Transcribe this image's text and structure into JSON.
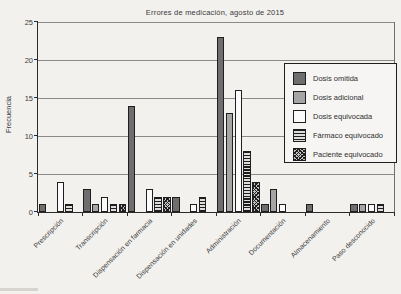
{
  "chart_data": {
    "type": "bar",
    "title": "Errores de medicación, agosto de 2015",
    "xlabel": "",
    "ylabel": "Frecuencia",
    "ylim": [
      0,
      25
    ],
    "yticks": [
      0,
      5,
      10,
      15,
      20,
      25
    ],
    "grid": true,
    "legend_position": "inside-right",
    "categories": [
      "Prescripción",
      "Transcripción",
      "Dispensación en farmacia",
      "Dispensación en unidades",
      "Administración",
      "Documentación",
      "Almacenamiento",
      "Paso desconocido"
    ],
    "series": [
      {
        "name": "Dosis omitida",
        "pattern": "solid-dark",
        "color": "#6e6e6e",
        "values": [
          1,
          3,
          14,
          2,
          23,
          1,
          1,
          1
        ]
      },
      {
        "name": "Dosis adicional",
        "pattern": "solid-medium",
        "color": "#a5a5a5",
        "values": [
          0,
          1,
          0,
          0,
          13,
          3,
          0,
          1
        ]
      },
      {
        "name": "Dosis equivocada",
        "pattern": "solid-white",
        "color": "#fbfbfb",
        "values": [
          4,
          2,
          3,
          1,
          16,
          1,
          0,
          1
        ]
      },
      {
        "name": "Fármaco equivocado",
        "pattern": "hlines",
        "color": "#1c1c1c",
        "values": [
          1,
          1,
          2,
          2,
          8,
          0,
          0,
          1
        ]
      },
      {
        "name": "Paciente equivocado",
        "pattern": "crosshatch",
        "color": "#4a4a4a",
        "values": [
          0,
          1,
          2,
          0,
          4,
          0,
          0,
          0
        ]
      }
    ]
  }
}
